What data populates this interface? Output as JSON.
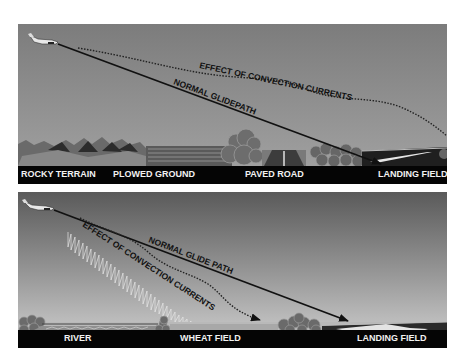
{
  "figure": {
    "type": "illustration",
    "panels": [
      {
        "id": "top",
        "glide_paths": {
          "normal": "NORMAL GLIDEPATH",
          "effect": "EFFECT OF CONVECTION CURRENTS"
        },
        "terrain_labels": [
          "ROCKY TERRAIN",
          "PLOWED GROUND",
          "PAVED ROAD",
          "LANDING FIELD"
        ],
        "colors": {
          "sky_top": "#7e7e7e",
          "sky_bottom": "#a2a2a2",
          "label_bar": "#050505"
        }
      },
      {
        "id": "bottom",
        "glide_paths": {
          "normal": "NORMAL GLIDE PATH",
          "effect": "EFFECT OF CONVECTION CURRENTS"
        },
        "terrain_labels": [
          "RIVER",
          "WHEAT FIELD",
          "LANDING FIELD"
        ],
        "colors": {
          "sky_top": "#5c5c5c",
          "sky_bottom": "#cfcfcf",
          "label_bar": "#050505"
        }
      }
    ]
  }
}
